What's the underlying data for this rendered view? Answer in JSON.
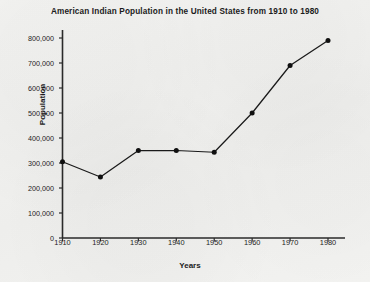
{
  "chart_data": {
    "type": "line",
    "title": "American Indian Population in the United States from 1910 to 1980",
    "xlabel": "Years",
    "ylabel": "Population",
    "categories": [
      1910,
      1920,
      1930,
      1940,
      1950,
      1960,
      1970,
      1980
    ],
    "values": [
      305000,
      244000,
      350000,
      350000,
      343000,
      500000,
      690000,
      790000
    ],
    "x_tick_labels": [
      "1910",
      "1920",
      "1930",
      "1940",
      "1950",
      "1960",
      "1970",
      "1980"
    ],
    "y_tick_labels": [
      "0",
      "100,000",
      "200,000",
      "300,000",
      "400,000",
      "500,000",
      "600,000",
      "700,000",
      "800,000"
    ],
    "y_tick_values": [
      0,
      100000,
      200000,
      300000,
      400000,
      500000,
      600000,
      700000,
      800000
    ],
    "xlim": [
      1910,
      1980
    ],
    "ylim": [
      0,
      800000
    ],
    "grid": false,
    "legend": false,
    "marker": "filled-circle",
    "line_color": "#1a1a1a",
    "marker_color": "#101010",
    "axis_color": "#2a2a2a",
    "background_color": "#f2f2f0",
    "text_color": "#1b1b1b"
  }
}
